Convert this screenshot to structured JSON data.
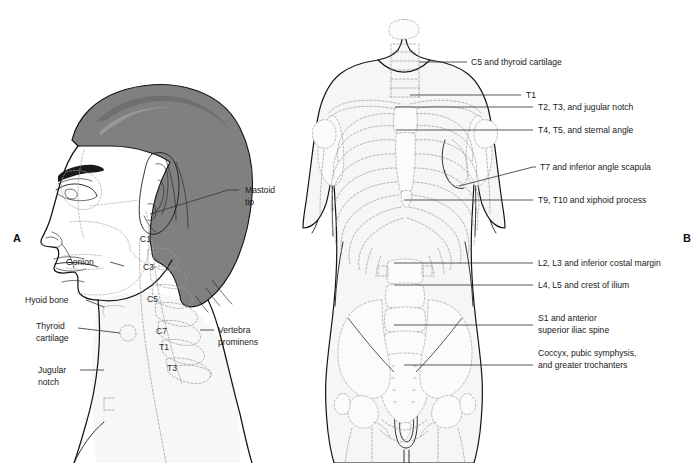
{
  "figure": {
    "panels": [
      {
        "letter": "A",
        "caption": "Lateral head and neck"
      },
      {
        "letter": "B",
        "caption": "Anterior trunk"
      }
    ],
    "colors": {
      "background": "#ffffff",
      "hair": "#808080",
      "hair_shadow": "#6f6f6f",
      "body_fill": "#f6f6f6",
      "outline": "#141414",
      "dashed_bone": "#9d9d9d",
      "leader_line": "#3a3a3a",
      "label_text": "#1a1a1a"
    }
  },
  "panel_a": {
    "letter": "A",
    "callouts": [
      {
        "id": "mastoid-tip",
        "line1": "Mastoid",
        "line2": "tip"
      },
      {
        "id": "gonion",
        "line1": "Gonion",
        "line2": ""
      },
      {
        "id": "hyoid-bone",
        "line1": "Hyoid bone",
        "line2": ""
      },
      {
        "id": "thyroid-cartilage",
        "line1": "Thyroid",
        "line2": "cartilage"
      },
      {
        "id": "jugular-notch",
        "line1": "Jugular",
        "line2": "notch"
      },
      {
        "id": "vertebra-prominens",
        "line1": "Vertebra",
        "line2": "prominens"
      }
    ],
    "vertebrae": [
      {
        "id": "c1",
        "label": "C1"
      },
      {
        "id": "c3",
        "label": "C3"
      },
      {
        "id": "c5",
        "label": "C5"
      },
      {
        "id": "c7",
        "label": "C7"
      },
      {
        "id": "t1",
        "label": "T1"
      },
      {
        "id": "t3",
        "label": "T3"
      }
    ]
  },
  "panel_b": {
    "letter": "B",
    "callouts": [
      {
        "id": "c5-thyroid-cartilage",
        "line1": "C5 and thyroid cartilage",
        "line2": ""
      },
      {
        "id": "t1",
        "line1": "T1",
        "line2": ""
      },
      {
        "id": "t2-t3-jugular-notch",
        "line1": "T2, T3, and jugular notch",
        "line2": ""
      },
      {
        "id": "t4-t5-sternal-angle",
        "line1": "T4, T5, and sternal angle",
        "line2": ""
      },
      {
        "id": "t7-inferior-angle-scapula",
        "line1": "T7 and inferior angle scapula",
        "line2": ""
      },
      {
        "id": "t9-t10-xiphoid-process",
        "line1": "T9, T10 and xiphoid process",
        "line2": ""
      },
      {
        "id": "l2-l3-inferior-costal-margin",
        "line1": "L2, L3 and inferior costal margin",
        "line2": ""
      },
      {
        "id": "l4-l5-crest-of-ilium",
        "line1": "L4, L5 and crest of ilium",
        "line2": ""
      },
      {
        "id": "s1-anterior-superior-iliac-spine",
        "line1": "S1 and anterior",
        "line2": "superior iliac spine"
      },
      {
        "id": "coccyx-pubic-symphysis",
        "line1": "Coccyx, pubic symphysis,",
        "line2": "and greater trochanters"
      }
    ]
  }
}
